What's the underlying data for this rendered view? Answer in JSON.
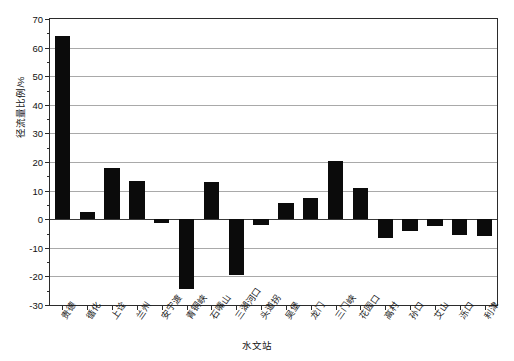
{
  "chart_data": {
    "type": "bar",
    "title": "",
    "xlabel": "水文站",
    "ylabel": "径流量比例/%",
    "ylim": [
      -30,
      70
    ],
    "ytick_step": 10,
    "grid": true,
    "legend": null,
    "bar_color": "#0b0b0b",
    "categories": [
      "贵德",
      "循化",
      "上诠",
      "兰州",
      "安宁渡",
      "青铜峡",
      "石嘴山",
      "三湖河口",
      "头道拐",
      "吴堡",
      "龙门",
      "三门峡",
      "花园口",
      "高村",
      "孙口",
      "艾山",
      "泺口",
      "利津"
    ],
    "values": [
      64,
      2.5,
      17.8,
      13.5,
      -1.5,
      -24.5,
      13,
      -19.5,
      -2,
      5.5,
      7.5,
      20.5,
      11,
      -6.5,
      -4,
      -2.5,
      -5.5,
      -6
    ],
    "yticks": [
      70,
      60,
      50,
      40,
      30,
      20,
      10,
      0,
      -10,
      -20,
      -30
    ],
    "ytick_labels": [
      "70",
      "60",
      "50",
      "40",
      "30",
      "20",
      "10",
      "0",
      "-10",
      "-20",
      "-30"
    ]
  }
}
